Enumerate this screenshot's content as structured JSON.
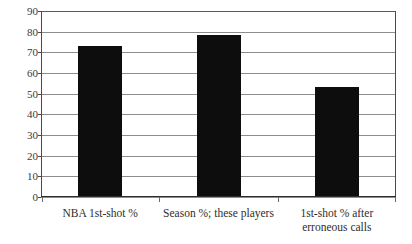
{
  "chart_data": {
    "type": "bar",
    "title": "",
    "xlabel": "",
    "ylabel": "",
    "ylim": [
      0,
      90
    ],
    "grid": true,
    "legend": "none",
    "bar_color": "#0d0d0d",
    "categories": [
      "NBA 1st-shot %",
      "Season %; these players",
      "1st-shot % after erroneous calls"
    ],
    "category_lines": [
      [
        "NBA 1st-shot %"
      ],
      [
        "Season %; these players"
      ],
      [
        "1st-shot % after",
        "erroneous calls"
      ]
    ],
    "values": [
      73,
      78.5,
      53
    ],
    "y_ticks": [
      90,
      80,
      70,
      60,
      50,
      40,
      30,
      20,
      10,
      0
    ],
    "y_tick_labels": [
      "90",
      "80",
      "70",
      "60",
      "50",
      "40",
      "30",
      "20",
      "10",
      "0"
    ]
  }
}
